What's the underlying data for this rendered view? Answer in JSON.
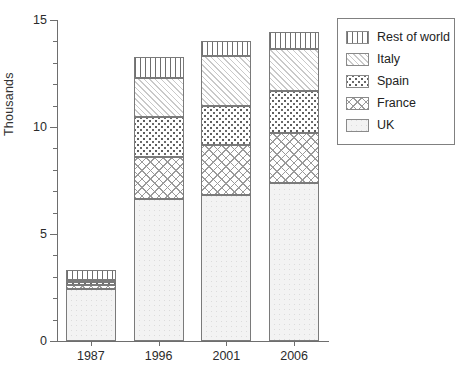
{
  "chart_data": {
    "type": "bar",
    "subtype": "stacked-bar",
    "title": "",
    "xlabel": "",
    "ylabel": "Thousands",
    "categories": [
      "1987",
      "1996",
      "2001",
      "2006"
    ],
    "ylim": [
      0,
      15
    ],
    "yticks": [
      0,
      5,
      10,
      15
    ],
    "ytick_labels": [
      "0",
      "5",
      "10",
      "15"
    ],
    "minor_tick_interval": 1,
    "grid": false,
    "legend_position": "right-outside",
    "stack_order_bottom_to_top": [
      "UK",
      "France",
      "Spain",
      "Italy",
      "Rest of world"
    ],
    "series": [
      {
        "name": "UK",
        "pattern": "light-stipple",
        "values": [
          2.45,
          6.65,
          6.8,
          7.4
        ]
      },
      {
        "name": "France",
        "pattern": "cross-hatch",
        "values": [
          0.15,
          1.95,
          2.35,
          2.3
        ]
      },
      {
        "name": "Spain",
        "pattern": "dotted",
        "values": [
          0.15,
          1.85,
          1.85,
          2.0
        ]
      },
      {
        "name": "Italy",
        "pattern": "diagonal-hatch",
        "values": [
          0.1,
          1.85,
          2.3,
          1.95
        ]
      },
      {
        "name": "Rest of world",
        "pattern": "vertical-lines",
        "values": [
          0.45,
          0.95,
          0.7,
          0.8
        ]
      }
    ],
    "totals": [
      3.3,
      13.25,
      14.0,
      14.45
    ]
  },
  "axis": {
    "y_label": "Thousands",
    "y_ticks": [
      "0",
      "5",
      "10",
      "15"
    ],
    "x_ticks": [
      "1987",
      "1996",
      "2001",
      "2006"
    ]
  },
  "legend": {
    "items": [
      {
        "label": "Rest of world",
        "pattern": "vertical-lines"
      },
      {
        "label": "Italy",
        "pattern": "diagonal-hatch"
      },
      {
        "label": "Spain",
        "pattern": "dotted"
      },
      {
        "label": "France",
        "pattern": "cross-hatch"
      },
      {
        "label": "UK",
        "pattern": "light-stipple"
      }
    ]
  },
  "colors": {
    "axis": "#6e6e6e",
    "bar_outline": "#7a7a7a",
    "text": "#2b2b2b",
    "background": "#ffffff"
  }
}
